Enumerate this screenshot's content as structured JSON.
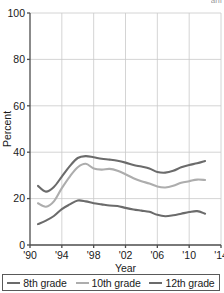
{
  "clipped_header_text": "ani",
  "chart_data": {
    "type": "line",
    "title": "",
    "xlabel": "Year",
    "ylabel": "Percent",
    "xlim": [
      1990,
      2014
    ],
    "ylim": [
      0,
      100
    ],
    "xticks": [
      1990,
      1994,
      1998,
      2002,
      2006,
      2010,
      2014
    ],
    "xticklabels": [
      "'90",
      "'94",
      "'98",
      "'02",
      "'06",
      "'10",
      "'14"
    ],
    "yticks": [
      0,
      20,
      40,
      60,
      80,
      100
    ],
    "yticklabels": [
      "0",
      "20",
      "40",
      "60",
      "80",
      "100"
    ],
    "grid": true,
    "legend_position": "bottom",
    "x": [
      1991,
      1992,
      1993,
      1994,
      1995,
      1996,
      1997,
      1998,
      1999,
      2000,
      2001,
      2002,
      2003,
      2004,
      2005,
      2006,
      2007,
      2008,
      2009,
      2010,
      2011,
      2012
    ],
    "series": [
      {
        "name": "8th grade",
        "color": "#6b6b6b",
        "values": [
          9.0,
          10.5,
          12.5,
          15.5,
          17.5,
          19.2,
          18.8,
          18.0,
          17.5,
          17.0,
          16.8,
          16.0,
          15.3,
          14.8,
          14.3,
          13.0,
          12.4,
          12.8,
          13.5,
          14.2,
          14.6,
          13.5
        ]
      },
      {
        "name": "10th grade",
        "color": "#adadad",
        "values": [
          18.0,
          16.5,
          18.8,
          24.5,
          29.5,
          33.5,
          35.0,
          33.0,
          32.5,
          32.8,
          32.0,
          30.5,
          28.8,
          27.5,
          26.5,
          25.2,
          24.8,
          25.5,
          26.8,
          27.5,
          28.2,
          28.0
        ]
      },
      {
        "name": "12th grade",
        "color": "#6b6b6b",
        "values": [
          25.5,
          23.0,
          25.0,
          29.5,
          34.0,
          37.5,
          38.3,
          37.8,
          37.2,
          36.8,
          36.3,
          35.5,
          34.5,
          33.8,
          33.0,
          31.5,
          31.2,
          32.0,
          33.5,
          34.5,
          35.2,
          36.2
        ]
      }
    ]
  }
}
